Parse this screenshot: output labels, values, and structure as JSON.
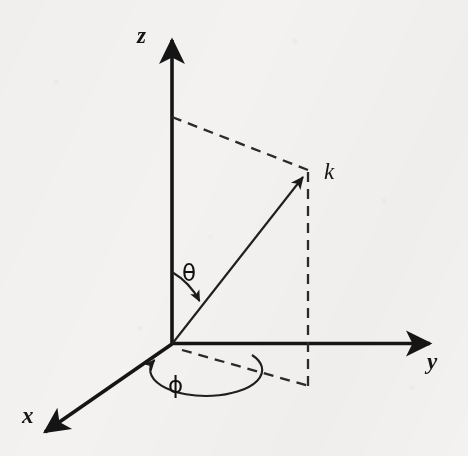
{
  "figure": {
    "background_color": "#f3f2f0",
    "ink_color": "#151515"
  },
  "labels": {
    "z_axis": "z",
    "y_axis": "y",
    "x_axis": "x",
    "vector_k": "k",
    "polar_angle": "θ",
    "azimuthal_angle": "ϕ"
  },
  "geometry": {
    "origin": {
      "x": 172,
      "y": 344
    },
    "z_axis_tip": {
      "x": 172,
      "y": 33
    },
    "y_axis_tip": {
      "x": 437,
      "y": 343
    },
    "x_axis_tip": {
      "x": 38,
      "y": 437
    },
    "k_vector_tip": {
      "x": 308,
      "y": 172
    },
    "k_projection_xy": {
      "x": 308,
      "y": 385
    },
    "z_dashed_start": {
      "x": 172,
      "y": 117
    },
    "theta_arrow_tip": {
      "x": 197,
      "y": 303
    },
    "phi_arrow_tip": {
      "x": 151,
      "y": 361
    }
  }
}
